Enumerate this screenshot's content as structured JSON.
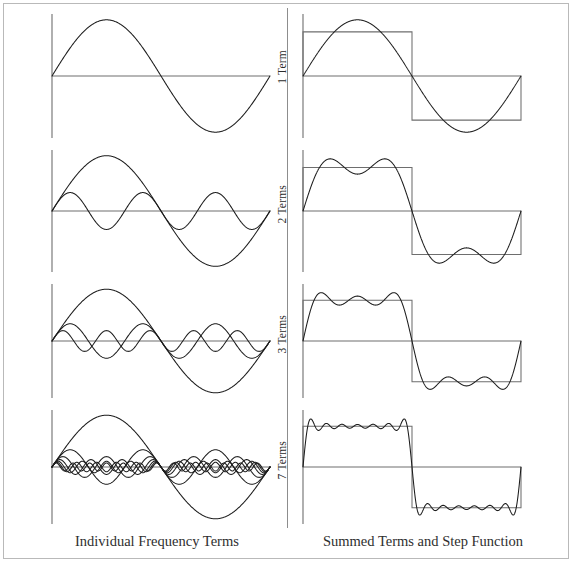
{
  "figure": {
    "left_caption": "Individual Frequency Terms",
    "right_caption": "Summed Terms and Step Function",
    "frame_color": "#b9b9b9",
    "wave_color": "#1c1c1c",
    "axis_color": "#6e6e6e",
    "square_color": "#6e6e6e"
  },
  "rows": [
    {
      "label": "1 Term",
      "terms": 1,
      "harmonics": [
        1
      ]
    },
    {
      "label": "2 Terms",
      "terms": 2,
      "harmonics": [
        1,
        3
      ]
    },
    {
      "label": "3 Terms",
      "terms": 3,
      "harmonics": [
        1,
        3,
        5
      ]
    },
    {
      "label": "7 Terms",
      "terms": 7,
      "harmonics": [
        1,
        3,
        5,
        7,
        9,
        11,
        13
      ]
    }
  ],
  "chart_data": {
    "type": "line",
    "xlabel": "",
    "ylabel": "",
    "grid": false,
    "legend": "none",
    "xlim": [
      0,
      1
    ],
    "ylim": [
      -1.45,
      1.45
    ],
    "x_units": "one full period (0 to 2π)",
    "target_function": {
      "name": "Step Function",
      "description": "Square wave: +1 for first half period, -1 for second half period",
      "amplitude": 1.0,
      "values": [
        1,
        -1
      ]
    },
    "series_amplitude_rule": "4/(nπ) for odd harmonic n",
    "panels": [
      {
        "panel": "Individual Frequency Terms",
        "column": "left",
        "rows": [
          {
            "label": "1 Term",
            "harmonics": [
              1
            ],
            "amplitudes": [
              1.273
            ]
          },
          {
            "label": "2 Terms",
            "harmonics": [
              1,
              3
            ],
            "amplitudes": [
              1.273,
              0.424
            ]
          },
          {
            "label": "3 Terms",
            "harmonics": [
              1,
              3,
              5
            ],
            "amplitudes": [
              1.273,
              0.424,
              0.255
            ]
          },
          {
            "label": "7 Terms",
            "harmonics": [
              1,
              3,
              5,
              7,
              9,
              11,
              13
            ],
            "amplitudes": [
              1.273,
              0.424,
              0.255,
              0.182,
              0.141,
              0.116,
              0.098
            ]
          }
        ]
      },
      {
        "panel": "Summed Terms and Step Function",
        "column": "right",
        "rows": [
          {
            "label": "1 Term",
            "harmonics": [
              1
            ],
            "overshoot": 1.273
          },
          {
            "label": "2 Terms",
            "harmonics": [
              1,
              3
            ],
            "overshoot": 1.2
          },
          {
            "label": "3 Terms",
            "harmonics": [
              1,
              3,
              5
            ],
            "overshoot": 1.2
          },
          {
            "label": "7 Terms",
            "harmonics": [
              1,
              3,
              5,
              7,
              9,
              11,
              13
            ],
            "overshoot": 1.18
          }
        ]
      }
    ]
  }
}
